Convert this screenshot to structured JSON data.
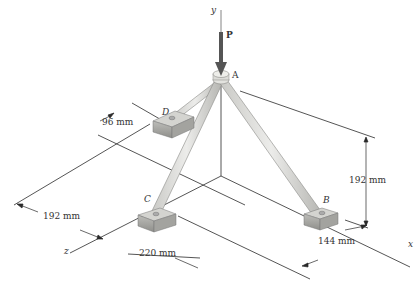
{
  "figure": {
    "axes": {
      "y": "y",
      "x": "x",
      "z": "z"
    },
    "points": {
      "A": "A",
      "B": "B",
      "C": "C",
      "D": "D"
    },
    "load": "P",
    "dimensions": {
      "d96": "96 mm",
      "d192_height": "192 mm",
      "d192_left": "192 mm",
      "d220": "220 mm",
      "d144": "144 mm"
    },
    "colors": {
      "line": "#2a2a2a",
      "member_fill": "#d9d9d6",
      "member_edge": "#8a8a86",
      "block_top": "#d4d4d0",
      "block_side": "#a8a8a4",
      "arrow": "#555555"
    }
  }
}
